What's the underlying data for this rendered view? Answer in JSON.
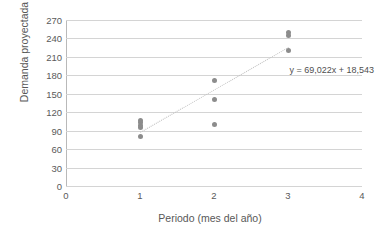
{
  "chart_data": {
    "type": "scatter",
    "title": "",
    "xlabel": "Periodo (mes del año)",
    "ylabel": "Demanda proyectada",
    "xlim": [
      0,
      4
    ],
    "ylim": [
      0,
      270
    ],
    "xticks": [
      "0",
      "1",
      "2",
      "3",
      "4"
    ],
    "yticks": [
      "0",
      "30",
      "60",
      "90",
      "120",
      "150",
      "180",
      "210",
      "240",
      "270"
    ],
    "grid": "horizontal",
    "legend": "none",
    "marker_color": "#8c8c8c",
    "trendline_color": "#c3c3c3",
    "points": [
      {
        "x": 1,
        "y": 81
      },
      {
        "x": 1,
        "y": 95
      },
      {
        "x": 1,
        "y": 99
      },
      {
        "x": 1,
        "y": 103
      },
      {
        "x": 1,
        "y": 107
      },
      {
        "x": 2,
        "y": 100
      },
      {
        "x": 2,
        "y": 140
      },
      {
        "x": 2,
        "y": 171
      },
      {
        "x": 3,
        "y": 220
      },
      {
        "x": 3,
        "y": 244
      },
      {
        "x": 3,
        "y": 250
      }
    ],
    "trendline": {
      "slope": 69.022,
      "intercept": 18.543,
      "x_start": 1,
      "x_end": 3
    },
    "annotations": [
      {
        "name": "trendline-equation",
        "text": "y = 69,022x + 18,543",
        "x": 3.02,
        "y": 196
      }
    ]
  }
}
